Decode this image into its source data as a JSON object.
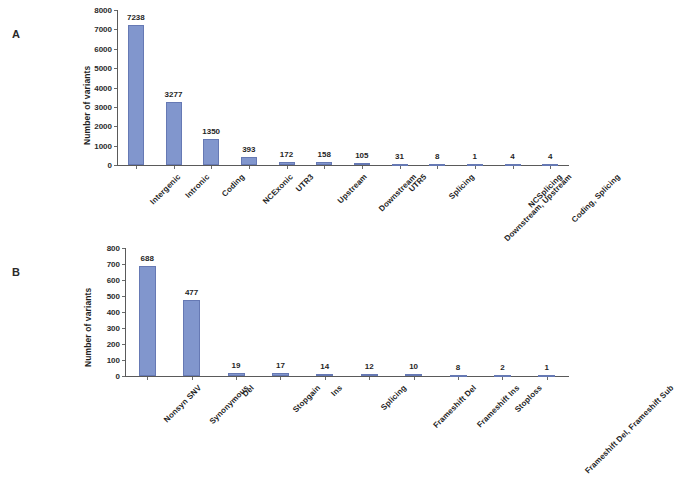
{
  "figure": {
    "panel_a_letter": "A",
    "panel_b_letter": "B"
  },
  "chart_data": [
    {
      "type": "bar",
      "panel": "A",
      "title": "",
      "xlabel": "",
      "ylabel": "Number of variants",
      "ylim": [
        0,
        8000
      ],
      "yticks": [
        0,
        1000,
        2000,
        3000,
        4000,
        5000,
        6000,
        7000,
        8000
      ],
      "grid": false,
      "legend": "none",
      "bar_color": "#8196cd",
      "categories": [
        "Intergenic",
        "Intronic",
        "Coding",
        "NCExonic",
        "UTR3",
        "Upstream",
        "Downstream",
        "UTR5",
        "Splicing",
        "Downstream, Upstream",
        "NCSplicing",
        "Coding, Splicing"
      ],
      "values": [
        7238,
        3277,
        1350,
        393,
        172,
        158,
        105,
        31,
        8,
        1,
        4,
        4
      ]
    },
    {
      "type": "bar",
      "panel": "B",
      "title": "",
      "xlabel": "",
      "ylabel": "Number of variants",
      "ylim": [
        0,
        800
      ],
      "yticks": [
        0,
        100,
        200,
        300,
        400,
        500,
        600,
        700,
        800
      ],
      "grid": false,
      "legend": "none",
      "bar_color": "#8196cd",
      "categories": [
        "Nonsyn SNV",
        "Synonymous",
        "Del",
        "Stopgain",
        "Ins",
        "Splicing",
        "Frameshift Del",
        "Frameshift Ins",
        "Stoploss",
        "Frameshift Del, Frameshift Sub"
      ],
      "values": [
        688,
        477,
        19,
        17,
        14,
        12,
        10,
        8,
        2,
        1
      ]
    }
  ]
}
